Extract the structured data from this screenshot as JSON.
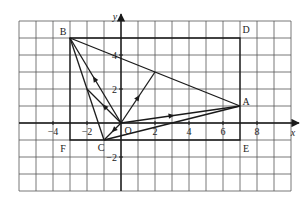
{
  "figure": {
    "type": "coordinate-geometry vector diagram",
    "colors": {
      "grid": "#555555",
      "lines": "#1a1a1a",
      "background": "#ffffff"
    },
    "grid": {
      "x_min": -6,
      "x_max": 10,
      "y_min": -4,
      "y_max": 6,
      "step": 1
    },
    "axes": {
      "x_label": "x",
      "y_label": "y",
      "origin_label": "O",
      "x_ticks": [
        {
          "value": -4,
          "label": "−4"
        },
        {
          "value": -2,
          "label": "−2"
        },
        {
          "value": 2,
          "label": "2"
        },
        {
          "value": 4,
          "label": "4"
        },
        {
          "value": 6,
          "label": "6"
        },
        {
          "value": 8,
          "label": "8"
        }
      ],
      "y_ticks": [
        {
          "value": 4,
          "label": "4"
        },
        {
          "value": 2,
          "label": "2"
        },
        {
          "value": -2,
          "label": "−2"
        }
      ]
    },
    "points": [
      {
        "name": "A",
        "x": 7,
        "y": 1
      },
      {
        "name": "B",
        "x": -3,
        "y": 5
      },
      {
        "name": "C",
        "x": -1,
        "y": -1
      },
      {
        "name": "D",
        "x": 7,
        "y": 5
      },
      {
        "name": "E",
        "x": 7,
        "y": -1
      },
      {
        "name": "F",
        "x": -3,
        "y": -1
      },
      {
        "name": "O",
        "x": 0,
        "y": 0
      }
    ],
    "rectangle": [
      "B",
      "D",
      "E",
      "F"
    ],
    "segments": [
      {
        "from": "B",
        "to": "A"
      },
      {
        "from": "B",
        "to": "C"
      },
      {
        "from": "C",
        "to": "A"
      }
    ],
    "vectors": [
      {
        "from": "O",
        "to": "A"
      },
      {
        "from": "O",
        "to": "B"
      },
      {
        "from": "O",
        "to": "C"
      },
      {
        "from": "O",
        "to_point": [
          2,
          3
        ],
        "description": "midpoint of BA"
      },
      {
        "from": "O",
        "to_point": [
          -2,
          2
        ],
        "description": "midpoint of BC"
      }
    ]
  }
}
